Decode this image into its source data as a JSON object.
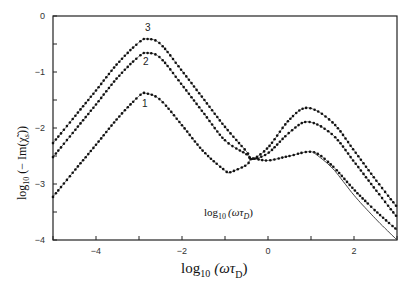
{
  "chart_data": {
    "type": "line",
    "title": "",
    "xlabel": "log10 (ωτD)",
    "ylabel": "log10 (− Im(χ̃s))",
    "xlim": [
      -5,
      3
    ],
    "ylim": [
      -4,
      0
    ],
    "x_ticks": [
      -4,
      -2,
      0,
      2
    ],
    "x_minor_ticks": [
      -5,
      -3,
      -1,
      1,
      3
    ],
    "y_ticks": [
      0,
      -1,
      -2,
      -3,
      -4
    ],
    "y_minor_ticks": [
      -0.5,
      -1.5,
      -2.5,
      -3.5
    ],
    "grid": false,
    "legend": "none (curves labeled inline 1, 2, 3)",
    "annotation": "log10 (ωτD)",
    "series": [
      {
        "name": "3",
        "style": "dotted-markers",
        "x": [
          -5,
          -4.5,
          -4,
          -3.5,
          -3,
          -2.8,
          -2.5,
          -2,
          -1.5,
          -1,
          -0.5,
          -0.37,
          0,
          0.5,
          0.93,
          1.5,
          2,
          2.5,
          3
        ],
        "y": [
          -2.27,
          -1.8,
          -1.33,
          -0.85,
          -0.47,
          -0.41,
          -0.5,
          -0.98,
          -1.48,
          -1.98,
          -2.42,
          -2.55,
          -2.35,
          -1.85,
          -1.64,
          -1.9,
          -2.4,
          -2.92,
          -3.41
        ]
      },
      {
        "name": "2",
        "style": "dotted-markers",
        "x": [
          -5,
          -4.5,
          -4,
          -3.5,
          -3,
          -2.8,
          -2.5,
          -2,
          -1.5,
          -1,
          -0.5,
          -0.37,
          0,
          0.5,
          0.93,
          1.5,
          2,
          2.5,
          3
        ],
        "y": [
          -2.52,
          -2.05,
          -1.58,
          -1.1,
          -0.72,
          -0.66,
          -0.75,
          -1.23,
          -1.73,
          -2.22,
          -2.47,
          -2.55,
          -2.45,
          -2.08,
          -1.89,
          -2.12,
          -2.6,
          -3.1,
          -3.59
        ]
      },
      {
        "name": "1",
        "style": "dotted-markers",
        "x": [
          -5,
          -4.5,
          -4,
          -3.5,
          -3,
          -2.84,
          -2.5,
          -2,
          -1.5,
          -1,
          -0.88,
          -0.5,
          -0.37,
          0,
          0.5,
          1.05,
          1.5,
          2,
          2.5,
          3
        ],
        "y": [
          -3.23,
          -2.76,
          -2.3,
          -1.83,
          -1.43,
          -1.38,
          -1.5,
          -1.95,
          -2.42,
          -2.76,
          -2.79,
          -2.66,
          -2.55,
          -2.58,
          -2.5,
          -2.43,
          -2.68,
          -3.1,
          -3.48,
          -3.82
        ]
      },
      {
        "name": "1 (asymptote)",
        "style": "solid-line",
        "x": [
          1.05,
          1.5,
          2,
          2.5,
          3
        ],
        "y": [
          -2.43,
          -2.72,
          -3.2,
          -3.62,
          -4.0
        ]
      }
    ]
  },
  "axes": {
    "x_tick_labels": [
      "−4",
      "−2",
      "0",
      "2"
    ],
    "y_tick_labels": [
      "0",
      "−1",
      "−2",
      "−3",
      "−4"
    ],
    "x_title_main": "log",
    "x_title_sub": "10",
    "x_title_paren": "(ωτ",
    "x_title_paren_sub": "D",
    "x_title_close": ")",
    "y_title_main": "log",
    "y_title_sub": "10",
    "y_title_rest": "(− Im(χ̃",
    "y_title_rest_sub": "s",
    "y_title_close": "))"
  },
  "annotation": {
    "main": "log",
    "sub": "10",
    "rest": "(ωτ",
    "rest_sub": "D",
    "close": ")"
  },
  "curve_labels": [
    "3",
    "2",
    "1"
  ]
}
